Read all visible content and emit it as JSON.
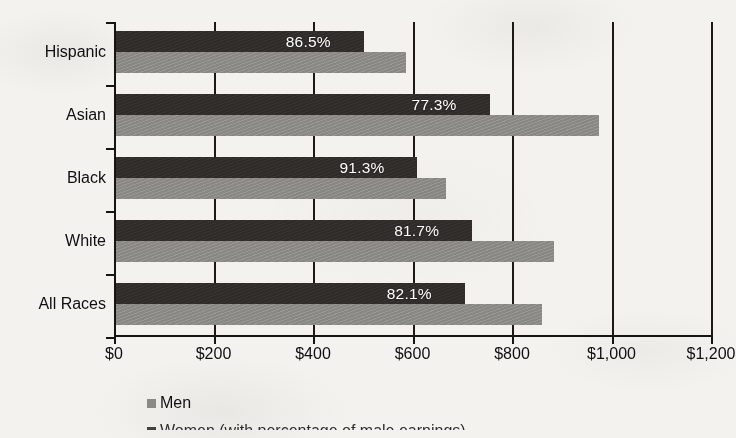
{
  "chart_data": {
    "type": "bar",
    "orientation": "horizontal",
    "grouped": true,
    "title": "",
    "xlabel": "",
    "ylabel": "",
    "xlim": [
      0,
      1200
    ],
    "xtick_step": 200,
    "grid": true,
    "gridlines_vertical": true,
    "legend_position": "bottom",
    "categories": [
      "Hispanic",
      "Asian",
      "Black",
      "White",
      "All Races"
    ],
    "xticklabels": [
      "$0",
      "$200",
      "$400",
      "$600",
      "$800",
      "$1,000",
      "$1,200"
    ],
    "xtickvalues": [
      0,
      200,
      400,
      600,
      800,
      1000,
      1200
    ],
    "series": [
      {
        "name": "Women (with percentage of male earnings)",
        "key": "women",
        "color": "#2e2b28",
        "values": [
          498,
          751,
          606,
          716,
          701
        ]
      },
      {
        "name": "Men",
        "key": "men",
        "color": "#8d8c88",
        "values": [
          582,
          971,
          664,
          880,
          856
        ]
      }
    ],
    "data_labels": {
      "series": "women",
      "values": [
        "86.5%",
        "77.3%",
        "91.3%",
        "81.7%",
        "82.1%"
      ],
      "numeric": [
        86.5,
        77.3,
        91.3,
        81.7,
        82.1
      ],
      "unit": "percent",
      "meaning": "women's earnings as a percentage of men's earnings"
    },
    "rows": [
      {
        "category": "Hispanic",
        "women": 498,
        "men": 582,
        "ratio_label": "86.5%"
      },
      {
        "category": "Asian",
        "women": 751,
        "men": 971,
        "ratio_label": "77.3%"
      },
      {
        "category": "Black",
        "women": 606,
        "men": 664,
        "ratio_label": "91.3%"
      },
      {
        "category": "White",
        "women": 716,
        "men": 880,
        "ratio_label": "81.7%"
      },
      {
        "category": "All Races",
        "women": 701,
        "men": 856,
        "ratio_label": "82.1%"
      }
    ]
  },
  "legend": {
    "items": [
      {
        "label": "Men",
        "swatch": "men"
      },
      {
        "label": "Women (with percentage of male earnings)",
        "swatch": "women"
      }
    ],
    "second_row_clipped": true
  },
  "colors": {
    "background": "#f3f2ef",
    "axis": "#17150f",
    "women_bar": "#2e2b28",
    "men_bar": "#8d8c88",
    "data_label_text": "#ffffff",
    "text": "#12100f"
  }
}
